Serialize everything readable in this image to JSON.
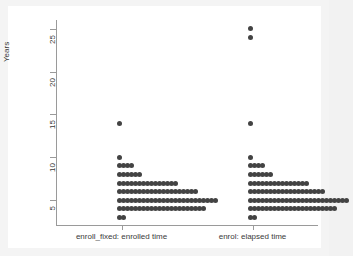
{
  "figure": {
    "background_color": "#f4f4f4",
    "plot_background_color": "#ffffff",
    "axis_color": "#9a9a9a",
    "marker_color": "#434343"
  },
  "chart_data": {
    "type": "scatter",
    "plot_style": "stacked dot plot (dot-density histogram)",
    "title": "",
    "xlabel": "",
    "ylabel": "Years",
    "ylim": [
      2,
      26
    ],
    "yticks": [
      5,
      10,
      15,
      20,
      25
    ],
    "ytick_labels": [
      "5",
      "10",
      "15",
      "20",
      "25"
    ],
    "grid": false,
    "legend": false,
    "categories": [
      "enroll_fixed: enrolled time",
      "enrol: elapsed time"
    ],
    "series": [
      {
        "name": "enroll_fixed: enrolled time",
        "x_position": 1,
        "stacks": [
          {
            "value": 3,
            "count": 2
          },
          {
            "value": 4,
            "count": 22
          },
          {
            "value": 5,
            "count": 25
          },
          {
            "value": 6,
            "count": 20
          },
          {
            "value": 7,
            "count": 15
          },
          {
            "value": 8,
            "count": 6
          },
          {
            "value": 9,
            "count": 4
          },
          {
            "value": 10,
            "count": 1
          },
          {
            "value": 14,
            "count": 1
          }
        ]
      },
      {
        "name": "enrol: elapsed time",
        "x_position": 2,
        "stacks": [
          {
            "value": 3,
            "count": 2
          },
          {
            "value": 4,
            "count": 22
          },
          {
            "value": 5,
            "count": 25
          },
          {
            "value": 6,
            "count": 19
          },
          {
            "value": 7,
            "count": 15
          },
          {
            "value": 8,
            "count": 6
          },
          {
            "value": 9,
            "count": 4
          },
          {
            "value": 10,
            "count": 1
          },
          {
            "value": 14,
            "count": 1
          },
          {
            "value": 24,
            "count": 1
          },
          {
            "value": 25,
            "count": 1
          }
        ]
      }
    ]
  }
}
